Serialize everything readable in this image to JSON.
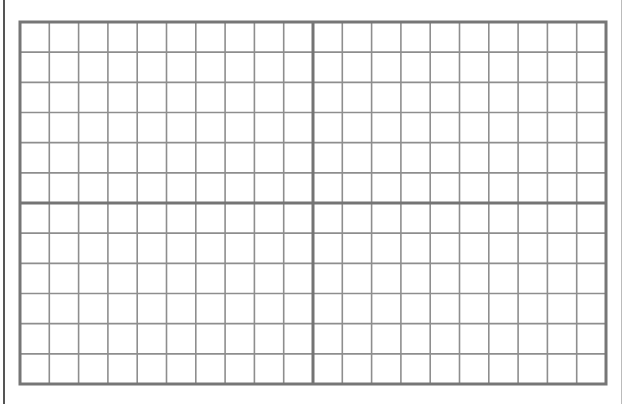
{
  "sheet": {
    "type": "graph-paper-grid",
    "grid": {
      "left": 20,
      "top": 22,
      "right": 606,
      "bottom": 384,
      "columns": 20,
      "rows": 12,
      "major_every_col": 10,
      "major_every_row": 6
    },
    "colors": {
      "background": "#ffffff",
      "minor_line": "#8e8e8e",
      "major_line": "#747474",
      "border": "#767676",
      "page_edge": "#555555"
    },
    "line_widths": {
      "minor": 1.6,
      "major": 3,
      "border": 3
    }
  }
}
